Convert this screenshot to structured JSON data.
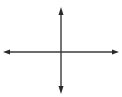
{
  "diagram": {
    "type": "coordinate-axes",
    "stroke_color": "#3a3a3a",
    "origin": {
      "x": 61,
      "y": 52
    },
    "x_axis": {
      "x1": 4,
      "x2": 118,
      "y": 52,
      "arrows": "both"
    },
    "y_axis": {
      "y1": 8,
      "y2": 93,
      "x": 61,
      "arrows": "both"
    }
  }
}
